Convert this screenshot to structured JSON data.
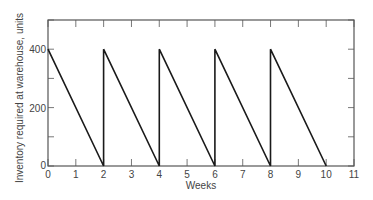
{
  "chart_data": {
    "type": "line",
    "title": "",
    "xlabel": "Weeks",
    "ylabel": "Inventory required at warehouse, units",
    "xlim": [
      0,
      11
    ],
    "ylim": [
      0,
      500
    ],
    "x_ticks": [
      0,
      1,
      2,
      3,
      4,
      5,
      6,
      7,
      8,
      9,
      10,
      11
    ],
    "y_ticks_labeled": [
      0,
      200,
      400
    ],
    "y_ticks_minor": [
      100,
      300,
      500
    ],
    "grid": false,
    "legend": null,
    "series": [
      {
        "name": "Inventory",
        "x": [
          0,
          2,
          2,
          4,
          4,
          6,
          6,
          8,
          8,
          10
        ],
        "y": [
          400,
          0,
          400,
          0,
          400,
          0,
          400,
          0,
          400,
          0
        ]
      }
    ]
  },
  "colors": {
    "line": "#1a1a1a",
    "axis": "#555555",
    "text": "#444444"
  }
}
